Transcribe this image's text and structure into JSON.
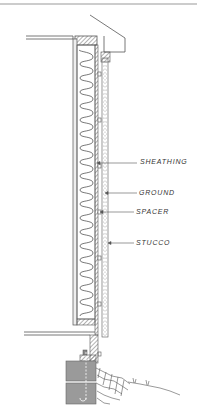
{
  "figure": {
    "labels": [
      {
        "id": "sheathing",
        "text": "SHEATHING",
        "x": 140,
        "y": 158
      },
      {
        "id": "ground",
        "text": "GROUND",
        "x": 139,
        "y": 189
      },
      {
        "id": "spacer",
        "text": "SPACER",
        "x": 136,
        "y": 208
      },
      {
        "id": "stucco",
        "text": "STUCCO",
        "x": 136,
        "y": 239
      }
    ]
  },
  "colors": {
    "line": "#555555",
    "hatch": "#777777",
    "concrete": "#9a9a9a",
    "background": "#ffffff"
  }
}
